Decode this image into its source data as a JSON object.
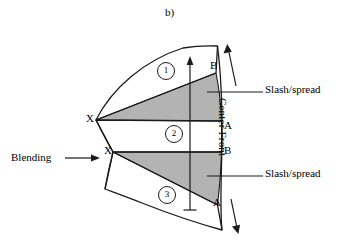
{
  "figure": {
    "panel_label": "b)",
    "background_color": "#ffffff",
    "line_color": "#1a1a1a",
    "shade_color": "#b3b3b3"
  },
  "annotations": {
    "blending": "Blending",
    "slash_spread_top": "Slash/spread",
    "slash_spread_bottom": "Slash/spread",
    "center_front": "Center Front"
  },
  "vertices": {
    "x_upper": "X",
    "x_lower": "X",
    "b_top": "B",
    "a_middle": "A",
    "b_middle": "B",
    "a_bottom": "A"
  },
  "regions": [
    {
      "id": "region-1",
      "number": "1"
    },
    {
      "id": "region-2",
      "number": "2"
    },
    {
      "id": "region-3",
      "number": "3"
    }
  ]
}
